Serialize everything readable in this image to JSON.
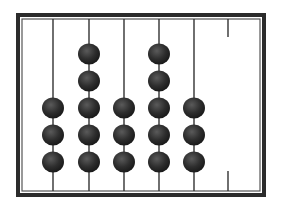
{
  "diagram": {
    "type": "abacus",
    "frame": {
      "x": 16,
      "y": 13,
      "width": 250,
      "height": 184,
      "color": "#2b2b2b"
    },
    "bead_color": "#2e2e2e",
    "rod_color": "#333333",
    "bead_radius": 11,
    "row_y": [
      162,
      135,
      108,
      81,
      54
    ],
    "rods": [
      {
        "x": 53,
        "beads": 3,
        "full": true
      },
      {
        "x": 89,
        "beads": 5,
        "full": true
      },
      {
        "x": 124,
        "beads": 3,
        "full": true
      },
      {
        "x": 159,
        "beads": 5,
        "full": true
      },
      {
        "x": 194,
        "beads": 3,
        "full": true
      },
      {
        "x": 228,
        "beads": 0,
        "full": false
      }
    ],
    "value_read": "353530"
  }
}
